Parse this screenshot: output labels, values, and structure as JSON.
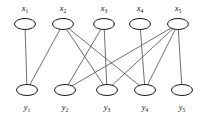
{
  "figure": {
    "type": "bipartite-graph",
    "width": 203,
    "height": 115,
    "background": "#ffffff",
    "edge_color": "#555555",
    "node_stroke_color": "#1a1a1a",
    "node_fill_color": "#ffffff",
    "label_color": "#111111"
  },
  "top_row": {
    "label_y": 11,
    "node_cy": 24,
    "nodes": [
      {
        "id": "x1",
        "label": "x",
        "sub": "1",
        "cx": 25
      },
      {
        "id": "x2",
        "label": "x",
        "sub": "2",
        "cx": 63
      },
      {
        "id": "x3",
        "label": "x",
        "sub": "3",
        "cx": 104
      },
      {
        "id": "x4",
        "label": "x",
        "sub": "4",
        "cx": 140
      },
      {
        "id": "x5",
        "label": "x",
        "sub": "5",
        "cx": 178
      }
    ]
  },
  "bottom_row": {
    "label_y": 110,
    "node_cy": 90,
    "nodes": [
      {
        "id": "y1",
        "label": "y",
        "sub": "1",
        "cx": 27
      },
      {
        "id": "y2",
        "label": "y",
        "sub": "2",
        "cx": 65
      },
      {
        "id": "y3",
        "label": "y",
        "sub": "3",
        "cx": 107
      },
      {
        "id": "y4",
        "label": "y",
        "sub": "4",
        "cx": 145
      },
      {
        "id": "y5",
        "label": "y",
        "sub": "5",
        "cx": 182
      }
    ]
  },
  "node_shape": {
    "rx": 10.5,
    "ry": 5.5
  },
  "edges": [
    {
      "from": "x1",
      "to": "y1"
    },
    {
      "from": "x2",
      "to": "y1"
    },
    {
      "from": "x2",
      "to": "y3"
    },
    {
      "from": "x2",
      "to": "y4"
    },
    {
      "from": "x3",
      "to": "y2"
    },
    {
      "from": "x3",
      "to": "y3"
    },
    {
      "from": "x4",
      "to": "y4"
    },
    {
      "from": "x5",
      "to": "y2"
    },
    {
      "from": "x5",
      "to": "y3"
    },
    {
      "from": "x5",
      "to": "y4"
    },
    {
      "from": "x5",
      "to": "y5"
    }
  ]
}
